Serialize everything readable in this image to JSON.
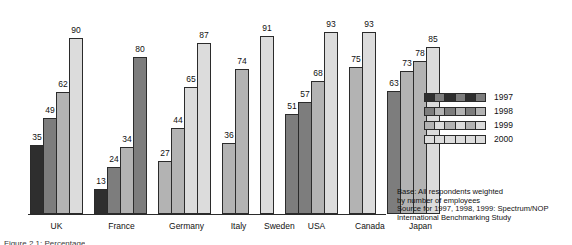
{
  "chart_data": {
    "type": "bar",
    "title": "",
    "xlabel": "",
    "ylabel": "",
    "ylim": [
      0,
      100
    ],
    "grid": false,
    "legend_position": "right",
    "categories": [
      "UK",
      "France",
      "Germany",
      "Italy",
      "Sweden",
      "USA",
      "Canada",
      "Japan"
    ],
    "series": [
      {
        "name": "1997",
        "color": "#2e2e2e",
        "values": [
          35,
          13,
          27,
          null,
          null,
          51,
          null,
          null
        ]
      },
      {
        "name": "1998",
        "color": "#7d7d7d",
        "values": [
          49,
          24,
          44,
          36,
          null,
          57,
          null,
          63
        ]
      },
      {
        "name": "1999",
        "color": "#b3b3b3",
        "values": [
          62,
          34,
          65,
          74,
          null,
          68,
          75,
          73
        ]
      },
      {
        "name": "2000",
        "color": "#dcdcdc",
        "values": [
          90,
          80,
          87,
          null,
          91,
          93,
          93,
          85
        ]
      }
    ],
    "extra_bars_note": "Japan shows four bars: 63, 73, 78, 85",
    "groups": [
      {
        "label": "UK",
        "bars": [
          {
            "series": "1997",
            "value": 35,
            "shade": 0
          },
          {
            "series": "1998",
            "value": 49,
            "shade": 1
          },
          {
            "series": "1999",
            "value": 62,
            "shade": 2
          },
          {
            "series": "2000",
            "value": 90,
            "shade": 3
          }
        ]
      },
      {
        "label": "France",
        "bars": [
          {
            "series": "1997",
            "value": 13,
            "shade": 0
          },
          {
            "series": "1998",
            "value": 24,
            "shade": 1
          },
          {
            "series": "1999",
            "value": 34,
            "shade": 2
          },
          {
            "series": "2000",
            "value": 80,
            "shade": 1
          }
        ]
      },
      {
        "label": "Germany",
        "bars": [
          {
            "series": "1997",
            "value": 27,
            "shade": 2
          },
          {
            "series": "1998",
            "value": 44,
            "shade": 2
          },
          {
            "series": "1999",
            "value": 65,
            "shade": 3
          },
          {
            "series": "2000",
            "value": 87,
            "shade": 3
          }
        ]
      },
      {
        "label": "Italy",
        "bars": [
          {
            "series": "1998",
            "value": 36,
            "shade": 2
          },
          {
            "series": "1999",
            "value": 74,
            "shade": 2
          }
        ]
      },
      {
        "label": "Sweden",
        "bars": [
          {
            "series": "2000",
            "value": 91,
            "shade": 3
          }
        ]
      },
      {
        "label": "USA",
        "bars": [
          {
            "series": "1997",
            "value": 51,
            "shade": 1
          },
          {
            "series": "1998",
            "value": 57,
            "shade": 1
          },
          {
            "series": "1999",
            "value": 68,
            "shade": 2
          },
          {
            "series": "2000",
            "value": 93,
            "shade": 3
          }
        ]
      },
      {
        "label": "Canada",
        "bars": [
          {
            "series": "1999",
            "value": 75,
            "shade": 2
          },
          {
            "series": "2000",
            "value": 93,
            "shade": 3
          }
        ]
      },
      {
        "label": "Japan",
        "bars": [
          {
            "series": "1997",
            "value": 63,
            "shade": 1
          },
          {
            "series": "1998",
            "value": 73,
            "shade": 2
          },
          {
            "series": "1999",
            "value": 78,
            "shade": 2
          },
          {
            "series": "2000",
            "value": 85,
            "shade": 3
          }
        ]
      }
    ]
  },
  "legend": {
    "entries": [
      {
        "label": "1997",
        "shade": 0
      },
      {
        "label": "1998",
        "shade": 1
      },
      {
        "label": "1999",
        "shade": 2
      },
      {
        "label": "2000",
        "shade": 3
      }
    ]
  },
  "note": {
    "lines": [
      "Base: All respondents weighted",
      "by number of employees",
      "Source for 1997, 1998, 1999: Spectrum/NOP",
      "International Benchmarking Study"
    ]
  },
  "caption": {
    "text": "Figure 2.1: Percentage"
  }
}
